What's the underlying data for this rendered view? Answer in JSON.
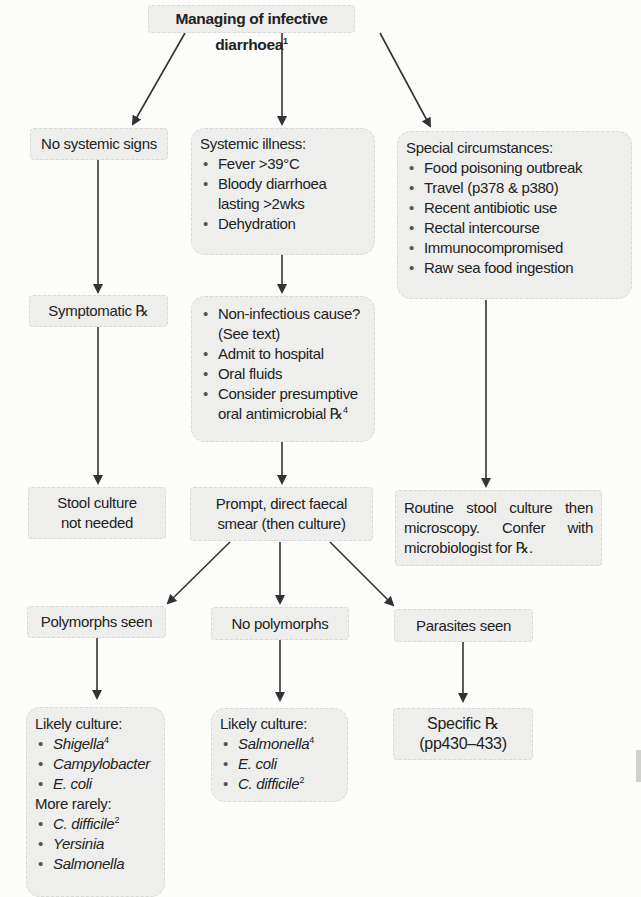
{
  "title": {
    "text": "Managing of infective diarrhoea",
    "sup": "1"
  },
  "column_left": {
    "no_systemic": "No systemic signs",
    "symptomatic": "Symptomatic ℞",
    "stool_not_needed": [
      "Stool culture",
      "not needed"
    ]
  },
  "column_middle": {
    "systemic_heading": "Systemic illness:",
    "systemic_items": [
      "Fever >39°C",
      "Bloody diarrhoea lasting >2wks",
      "Dehydration"
    ],
    "management_items": [
      "Non-infectious cause? (See text)",
      "Admit to hospital",
      "Oral fluids",
      "Consider presumptive oral antimicrobial ℞"
    ],
    "management_sup": "4",
    "smear": [
      "Prompt, direct faecal",
      "smear (then culture)"
    ]
  },
  "column_right": {
    "special_heading": "Special circumstances:",
    "special_items": [
      "Food poisoning outbreak",
      "Travel (p378 & p380)",
      "Recent antibiotic use",
      "Rectal intercourse",
      "Immunocompromised",
      "Raw sea food ingestion"
    ],
    "routine": "Routine stool culture then microscopy. Confer with microbiologist for ℞."
  },
  "smear_results": {
    "polymorphs": "Polymorphs seen",
    "no_polymorphs": "No polymorphs",
    "parasites": "Parasites seen"
  },
  "outcomes": {
    "polymorphs_culture": {
      "heading": "Likely culture:",
      "items": [
        {
          "name": "Shigella",
          "sup": "4"
        },
        {
          "name": "Campylobacter"
        },
        {
          "name": "E. coli"
        }
      ],
      "rare_heading": "More rarely:",
      "rare_items": [
        {
          "name": "C. difficile",
          "sup": "2"
        },
        {
          "name": "Yersinia"
        },
        {
          "name": "Salmonella"
        }
      ]
    },
    "no_polymorphs_culture": {
      "heading": "Likely culture:",
      "items": [
        {
          "name": "Salmonella",
          "sup": "4"
        },
        {
          "name": "E. coli"
        },
        {
          "name": "C. difficile",
          "sup": "2"
        }
      ]
    },
    "parasites_rx": [
      "Specific ℞",
      "(pp430–433)"
    ]
  },
  "colors": {
    "box_fill": "#eeeeed",
    "box_border": "#d8d8d6",
    "arrow": "#333333",
    "text": "#222222"
  }
}
